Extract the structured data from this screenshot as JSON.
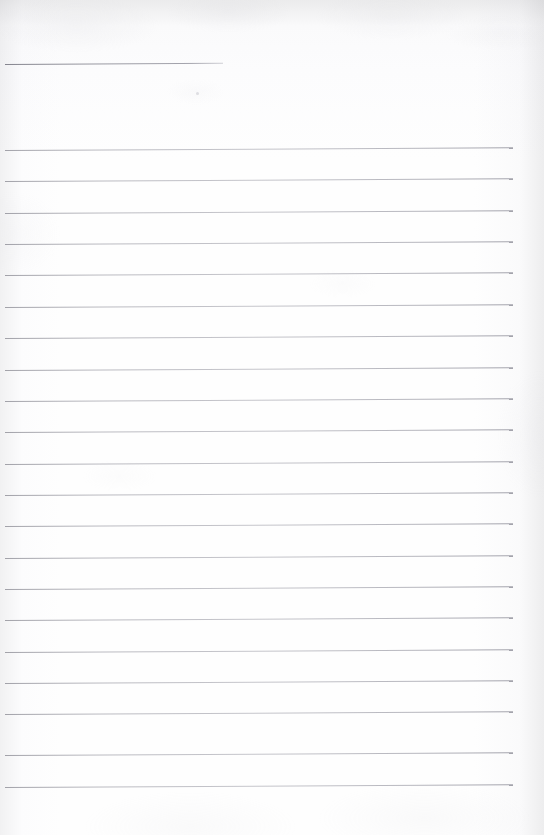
{
  "document": {
    "type": "ruled-notepaper",
    "title": "",
    "body_text": "",
    "is_blank": true,
    "width_px": 544,
    "height_px": 835
  },
  "appearance": {
    "paper_color": "#fdfdfe",
    "rule_color": "#b0b0b8",
    "header_rule_color": "#8a8a94",
    "vignette_color": "#ececed"
  },
  "layout": {
    "rule_left_x": 5,
    "rule_right_x": 513,
    "header_rule_right_x": 223,
    "first_rule_y": 64,
    "body_first_rule_y": 150,
    "rule_spacing": 31.35,
    "rule_thickness": 1,
    "tilt_deg": -0.3
  },
  "header_rule": {
    "name": "title-rule",
    "y": 64,
    "x_start": 5,
    "x_end": 223,
    "label": ""
  },
  "rules": [
    {
      "index": 1,
      "y": 150.0,
      "text": ""
    },
    {
      "index": 2,
      "y": 181.4,
      "text": ""
    },
    {
      "index": 3,
      "y": 212.7,
      "text": ""
    },
    {
      "index": 4,
      "y": 244.1,
      "text": ""
    },
    {
      "index": 5,
      "y": 275.4,
      "text": ""
    },
    {
      "index": 6,
      "y": 306.8,
      "text": ""
    },
    {
      "index": 7,
      "y": 338.1,
      "text": ""
    },
    {
      "index": 8,
      "y": 369.5,
      "text": ""
    },
    {
      "index": 9,
      "y": 400.8,
      "text": ""
    },
    {
      "index": 10,
      "y": 432.2,
      "text": ""
    },
    {
      "index": 11,
      "y": 463.5,
      "text": ""
    },
    {
      "index": 12,
      "y": 494.9,
      "text": ""
    },
    {
      "index": 13,
      "y": 526.2,
      "text": ""
    },
    {
      "index": 14,
      "y": 557.6,
      "text": ""
    },
    {
      "index": 15,
      "y": 588.9,
      "text": ""
    },
    {
      "index": 16,
      "y": 620.3,
      "text": ""
    },
    {
      "index": 17,
      "y": 651.6,
      "text": ""
    },
    {
      "index": 18,
      "y": 683.0,
      "text": ""
    },
    {
      "index": 19,
      "y": 714.3,
      "text": ""
    },
    {
      "index": 20,
      "y": 755.0,
      "text": ""
    },
    {
      "index": 21,
      "y": 786.5,
      "text": ""
    }
  ],
  "specks": [
    {
      "x": 196,
      "y": 92
    }
  ]
}
